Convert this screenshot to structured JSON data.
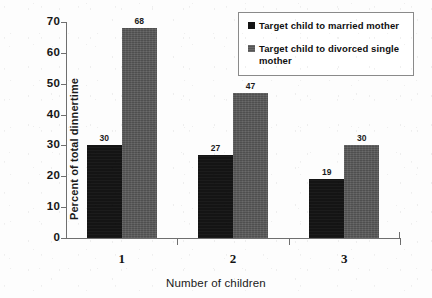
{
  "chart_data": {
    "type": "bar",
    "title": "",
    "xlabel": "Number of children",
    "ylabel": "Percent of total dinnertime",
    "categories": [
      "1",
      "2",
      "3"
    ],
    "series": [
      {
        "name": "Target child to married mother",
        "color": "#141414",
        "values": [
          30,
          27,
          19
        ]
      },
      {
        "name": "Target child to divorced single mother",
        "color": "#565656",
        "values": [
          68,
          47,
          30
        ]
      }
    ],
    "ylim": [
      0,
      70
    ],
    "yticks": [
      0,
      10,
      20,
      30,
      40,
      50,
      60,
      70
    ],
    "ytick_labels": [
      "0",
      "10",
      "20",
      "30",
      "40",
      "50",
      "60",
      "70"
    ],
    "grid": false,
    "legend_position": "top-right",
    "data_labels": true
  }
}
